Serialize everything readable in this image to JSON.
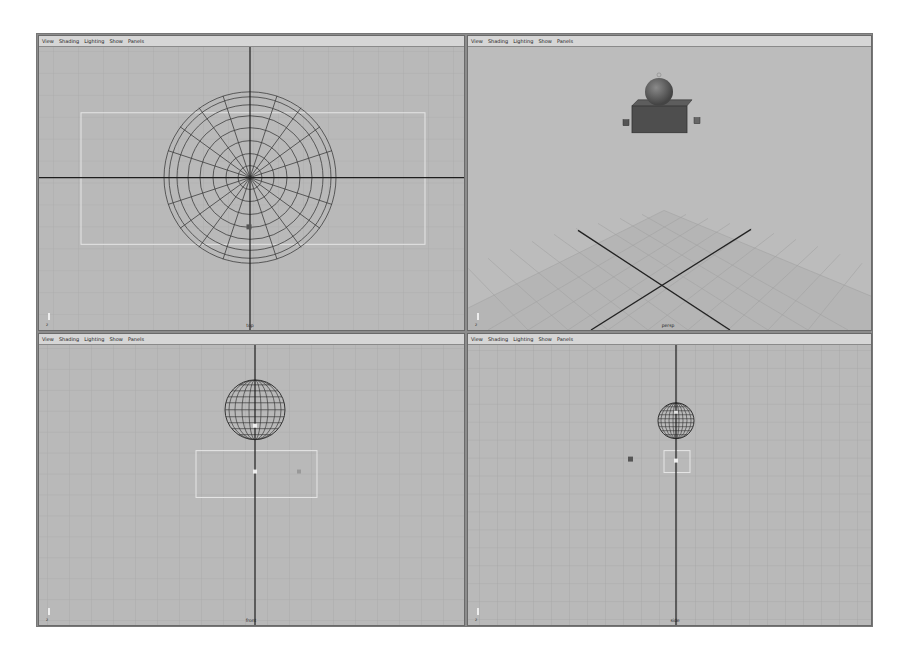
{
  "menu": [
    "View",
    "Shading",
    "Lighting",
    "Show",
    "Panels"
  ],
  "panels": [
    {
      "id": "top",
      "camera": "top",
      "axis": "z",
      "projection": "orthographic"
    },
    {
      "id": "persp",
      "camera": "persp",
      "axis": "z",
      "projection": "perspective"
    },
    {
      "id": "front",
      "camera": "front",
      "axis": "z",
      "projection": "orthographic"
    },
    {
      "id": "side",
      "camera": "side",
      "axis": "z",
      "projection": "orthographic"
    }
  ],
  "colors": {
    "viewport_bg": "#b9b9b9",
    "grid_line": "#a6a6a6",
    "axis_line": "#1e1e1e",
    "wireframe": "#3a3a3a",
    "menubar_bg": "#d6d6d6",
    "resolution_gate": "#e8e8e8"
  }
}
